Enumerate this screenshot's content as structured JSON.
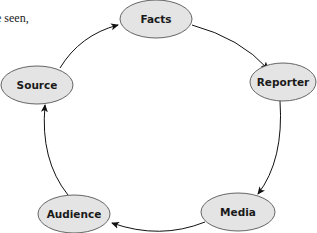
{
  "caption_fragment": "e seen,",
  "diagram": {
    "type": "cycle",
    "colors": {
      "node_fill": "#e4e4e4",
      "node_stroke": "#555555",
      "arrow": "#111111"
    },
    "nodes": [
      {
        "id": "facts",
        "label": "Facts"
      },
      {
        "id": "reporter",
        "label": "Reporter"
      },
      {
        "id": "media",
        "label": "Media"
      },
      {
        "id": "audience",
        "label": "Audience"
      },
      {
        "id": "source",
        "label": "Source"
      }
    ],
    "edges": [
      {
        "from": "Facts",
        "to": "Reporter"
      },
      {
        "from": "Reporter",
        "to": "Media"
      },
      {
        "from": "Media",
        "to": "Audience"
      },
      {
        "from": "Audience",
        "to": "Source"
      },
      {
        "from": "Source",
        "to": "Facts"
      }
    ]
  }
}
